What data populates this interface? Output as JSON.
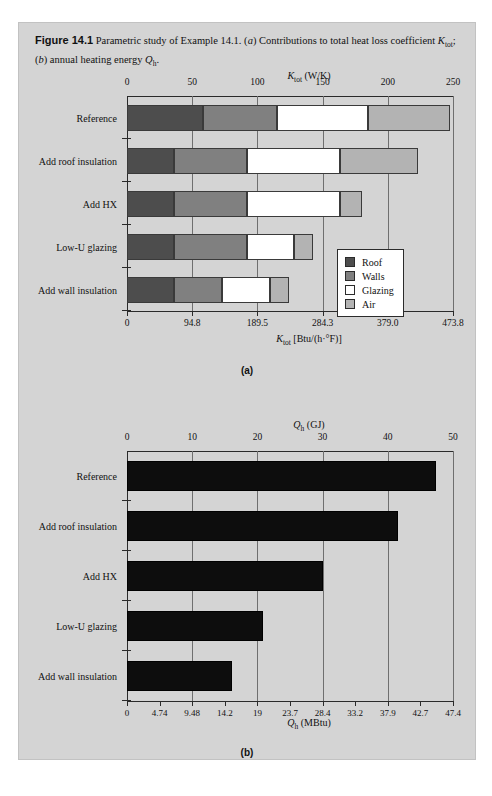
{
  "figure": {
    "number": "Figure 14.1",
    "caption_part1": "Parametric study of Example 14.1. (",
    "caption_a": "a",
    "caption_part2": ") Contributions to total heat loss coefficient ",
    "caption_ktot": "K",
    "caption_ktot_sub": "tot",
    "caption_part3": "; (",
    "caption_b": "b",
    "caption_part4": ") annual heating energy ",
    "caption_qh": "Q",
    "caption_qh_sub": "h",
    "caption_end": ".",
    "panel_a_label": "(a)",
    "panel_b_label": "(b)"
  },
  "chart_data": [
    {
      "type": "bar",
      "orientation": "horizontal",
      "stacked": true,
      "panel": "(a)",
      "title": "",
      "top_axis_title_main": "K",
      "top_axis_title_sub": "tot",
      "top_axis_title_unit": " (W/K)",
      "bottom_axis_title_main": "K",
      "bottom_axis_title_sub": "tot",
      "bottom_axis_title_unit": " [Btu/(h·°F)]",
      "categories": [
        "Reference",
        "Add roof insulation",
        "Add HX",
        "Low-U glazing",
        "Add wall insulation"
      ],
      "series": [
        {
          "name": "Roof",
          "color": "#4d4d4d",
          "values": [
            58,
            36,
            36,
            36,
            36
          ]
        },
        {
          "name": "Walls",
          "color": "#808080",
          "values": [
            57,
            56,
            56,
            56,
            37
          ]
        },
        {
          "name": "Glazing",
          "color": "#ffffff",
          "values": [
            70,
            71,
            71,
            36,
            37
          ]
        },
        {
          "name": "Air",
          "color": "#b3b3b3",
          "values": [
            63,
            60,
            17,
            15,
            14
          ]
        }
      ],
      "totals": [
        248,
        223,
        180,
        143,
        124
      ],
      "top_ticks": [
        "0",
        "50",
        "100",
        "150",
        "200",
        "250"
      ],
      "top_tick_values": [
        0,
        50,
        100,
        150,
        200,
        250
      ],
      "bottom_ticks": [
        "0",
        "94.8",
        "189.5",
        "284.3",
        "379.0",
        "473.8"
      ],
      "bottom_tick_values": [
        0,
        50,
        100,
        150,
        200,
        250
      ],
      "xlim": [
        0,
        250
      ],
      "grid": true,
      "legend": {
        "position": "inside-right",
        "entries": [
          {
            "label": "Roof",
            "color": "#4d4d4d"
          },
          {
            "label": "Walls",
            "color": "#808080"
          },
          {
            "label": "Glazing",
            "color": "#ffffff"
          },
          {
            "label": "Air",
            "color": "#b3b3b3"
          }
        ]
      }
    },
    {
      "type": "bar",
      "orientation": "horizontal",
      "stacked": false,
      "panel": "(b)",
      "top_axis_title_main": "Q",
      "top_axis_title_sub": "h",
      "top_axis_title_unit": " (GJ)",
      "bottom_axis_title_main": "Q",
      "bottom_axis_title_sub": "h",
      "bottom_axis_title_unit": " (MBtu)",
      "categories": [
        "Reference",
        "Add roof insulation",
        "Add HX",
        "Low-U glazing",
        "Add wall insulation"
      ],
      "values": [
        47.4,
        41.5,
        30.0,
        20.8,
        16.1
      ],
      "bar_color": "#0d0d0d",
      "top_ticks": [
        "0",
        "10",
        "20",
        "30",
        "40",
        "50"
      ],
      "top_tick_values": [
        0,
        10,
        20,
        30,
        40,
        50
      ],
      "bottom_ticks": [
        "0",
        "4.74",
        "9.48",
        "14.2",
        "19",
        "23.7",
        "28.4",
        "33.2",
        "37.9",
        "42.7",
        "47.4"
      ],
      "bottom_tick_values": [
        0,
        5,
        10,
        15,
        20,
        25,
        30,
        35,
        40,
        45,
        50
      ],
      "xlim": [
        0,
        50
      ],
      "grid": true
    }
  ]
}
